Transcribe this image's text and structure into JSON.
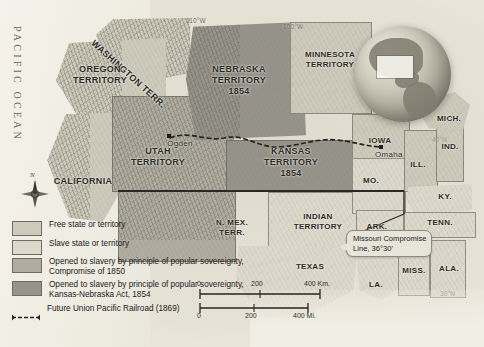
{
  "map": {
    "title": "Slavery Expansion and the Kansas-Nebraska Act, 1854",
    "ocean_label": "PACIFIC OCEAN",
    "compass_north": "N",
    "coordinates": [
      {
        "name": "110W",
        "label": "110°W"
      },
      {
        "name": "100W",
        "label": "100°W"
      },
      {
        "name": "40N",
        "label": "40°N"
      },
      {
        "name": "30N",
        "label": "30°N"
      }
    ],
    "territories": [
      {
        "name": "washington-territory",
        "lines": [
          "WASHINGTON TERR."
        ],
        "fill": "free"
      },
      {
        "name": "oregon-territory",
        "lines": [
          "OREGON",
          "TERRITORY"
        ],
        "fill": "free"
      },
      {
        "name": "california",
        "lines": [
          "CALIFORNIA"
        ],
        "fill": "free"
      },
      {
        "name": "utah-territory",
        "lines": [
          "UTAH",
          "TERRITORY"
        ],
        "fill": "pop1850"
      },
      {
        "name": "new-mexico-territory",
        "lines": [
          "N. MEX.",
          "TERR."
        ],
        "fill": "pop1850"
      },
      {
        "name": "nebraska-territory",
        "lines": [
          "NEBRASKA",
          "TERRITORY"
        ],
        "year": "1854",
        "fill": "kansneb1854"
      },
      {
        "name": "kansas-territory",
        "lines": [
          "KANSAS",
          "TERRITORY"
        ],
        "year": "1854",
        "fill": "kansneb1854"
      },
      {
        "name": "minnesota-territory",
        "lines": [
          "MINNESOTA",
          "TERRITORY"
        ],
        "fill": "free"
      },
      {
        "name": "indian-territory",
        "lines": [
          "INDIAN",
          "TERRITORY"
        ],
        "fill": "slave"
      }
    ],
    "states": [
      {
        "name": "iowa",
        "label": "IOWA",
        "fill": "free"
      },
      {
        "name": "missouri",
        "label": "MO.",
        "fill": "slave"
      },
      {
        "name": "arkansas",
        "label": "ARK.",
        "fill": "slave"
      },
      {
        "name": "texas",
        "label": "TEXAS",
        "fill": "slave"
      },
      {
        "name": "louisiana",
        "label": "LA.",
        "fill": "slave"
      },
      {
        "name": "illinois",
        "label": "ILL.",
        "fill": "free"
      },
      {
        "name": "indiana",
        "label": "IND.",
        "fill": "free"
      },
      {
        "name": "michigan",
        "label": "MICH.",
        "fill": "free"
      },
      {
        "name": "kentucky",
        "label": "KY.",
        "fill": "slave"
      },
      {
        "name": "tennessee",
        "label": "TENN.",
        "fill": "slave"
      },
      {
        "name": "mississippi",
        "label": "MISS.",
        "fill": "slave"
      },
      {
        "name": "alabama",
        "label": "ALA.",
        "fill": "slave"
      }
    ],
    "cities": [
      {
        "name": "ogden",
        "label": "Ogden"
      },
      {
        "name": "omaha",
        "label": "Omaha"
      }
    ],
    "annotation": {
      "missouri_compromise_line1": "Missouri Compromise",
      "missouri_compromise_line2": "Line, 36°30'"
    },
    "scale": {
      "km_ticks": [
        "0",
        "200",
        "400 Km."
      ],
      "mi_ticks": [
        "0",
        "200",
        "400 Mi."
      ]
    }
  },
  "legend": {
    "items": [
      {
        "name": "free-state",
        "swatch": "#cdcabb",
        "text": "Free state or territory"
      },
      {
        "name": "slave-state",
        "swatch": "#dcd8cb",
        "text": "Slave state or territory"
      },
      {
        "name": "popular-sovereignty-1850",
        "swatch": "#b0ada0",
        "text": "Opened to slavery by principle of popular sovereignty, Compromise of 1850"
      },
      {
        "name": "kansas-nebraska-1854",
        "swatch": "#96938a",
        "text": "Opened to slavery by principle of popular sovereignty, Kansas-Nebraska Act, 1854"
      },
      {
        "name": "union-pacific-railroad",
        "swatch": null,
        "text": "Future Union Pacific Railroad (1869)"
      }
    ]
  }
}
